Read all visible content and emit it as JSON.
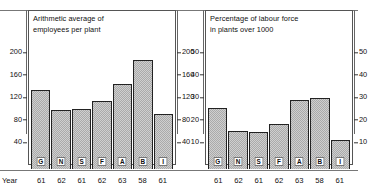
{
  "figure": {
    "year_axis_label": "Year"
  },
  "chart_data": [
    {
      "type": "bar",
      "title": "Arithmetic average of\nemployees per plant",
      "xlabel": "Year",
      "ylabel": "",
      "categories": [
        "G",
        "N",
        "S",
        "F",
        "A",
        "B",
        "I"
      ],
      "x_sub_labels": [
        "61",
        "62",
        "61",
        "62",
        "63",
        "58",
        "61"
      ],
      "values": [
        141,
        105,
        107,
        121,
        151,
        193,
        97
      ],
      "ylim": [
        0,
        220
      ],
      "yticks": [
        40,
        80,
        120,
        160,
        200
      ],
      "ytick_labels_left": [
        "40",
        "80",
        "120",
        "160",
        "200"
      ],
      "ytick_labels_right": [
        "40",
        "80",
        "120",
        "160",
        "200"
      ],
      "grid": false,
      "legend": "none"
    },
    {
      "type": "bar",
      "title": "Percentage of labour force\nin plants over 1000",
      "xlabel": "Year",
      "ylabel": "",
      "categories": [
        "G",
        "N",
        "S",
        "F",
        "A",
        "B",
        "I"
      ],
      "x_sub_labels": [
        "61",
        "62",
        "61",
        "62",
        "63",
        "58",
        "61"
      ],
      "values": [
        27,
        17,
        16.5,
        20,
        30.5,
        31.5,
        13
      ],
      "ylim": [
        0,
        55
      ],
      "yticks": [
        10,
        20,
        30,
        40,
        50
      ],
      "ytick_labels_left": [
        "10",
        "20",
        "30",
        "40",
        "50"
      ],
      "ytick_labels_right": [
        "10",
        "20",
        "30",
        "40",
        "50"
      ],
      "grid": false,
      "legend": "none"
    }
  ]
}
